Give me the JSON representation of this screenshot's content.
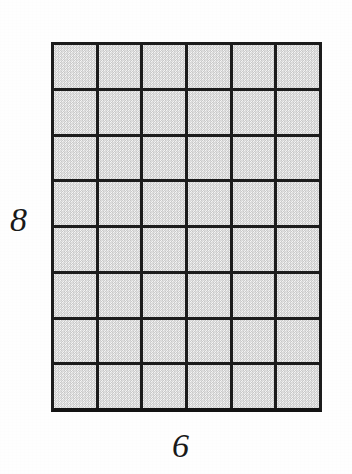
{
  "figure": {
    "type": "rectangular-array-grid",
    "labels": {
      "height_label": "8",
      "width_label": "6"
    },
    "grid": {
      "columns": 6,
      "rows": 8,
      "total_cells": 48
    },
    "colors": {
      "line": "#1c1c1c",
      "cell_fill": "#e9e9e9",
      "background": "#fefefe",
      "label_text": "#191919"
    }
  },
  "chart_data": {
    "type": "table",
    "title": "",
    "xlabel": "6",
    "ylabel": "8",
    "columns": 6,
    "rows": 8,
    "values": [
      [
        1,
        1,
        1,
        1,
        1,
        1
      ],
      [
        1,
        1,
        1,
        1,
        1,
        1
      ],
      [
        1,
        1,
        1,
        1,
        1,
        1
      ],
      [
        1,
        1,
        1,
        1,
        1,
        1
      ],
      [
        1,
        1,
        1,
        1,
        1,
        1
      ],
      [
        1,
        1,
        1,
        1,
        1,
        1
      ],
      [
        1,
        1,
        1,
        1,
        1,
        1
      ],
      [
        1,
        1,
        1,
        1,
        1,
        1
      ]
    ],
    "area": 48,
    "grid": true,
    "legend": false
  }
}
